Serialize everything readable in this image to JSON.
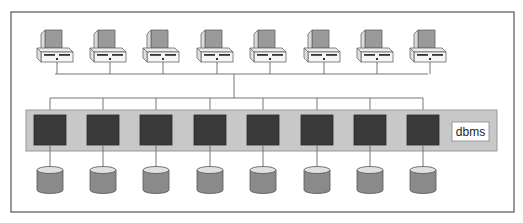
{
  "diagram": {
    "type": "shared-nothing database architecture",
    "label": "dbms",
    "clients": {
      "count": 8,
      "icon": "computer-icon"
    },
    "nodes": {
      "count": 8,
      "icon": "processor-node-icon"
    },
    "disks": {
      "count": 8,
      "icon": "disk-cylinder-icon"
    },
    "colors": {
      "frame": "#555555",
      "band": "#c8c8c8",
      "node": "#3a3a3a",
      "disk_body": "#8a8a8a",
      "disk_top": "#e0e0e0",
      "monitor_screen": "#9a9a9a",
      "line": "#777777"
    }
  }
}
